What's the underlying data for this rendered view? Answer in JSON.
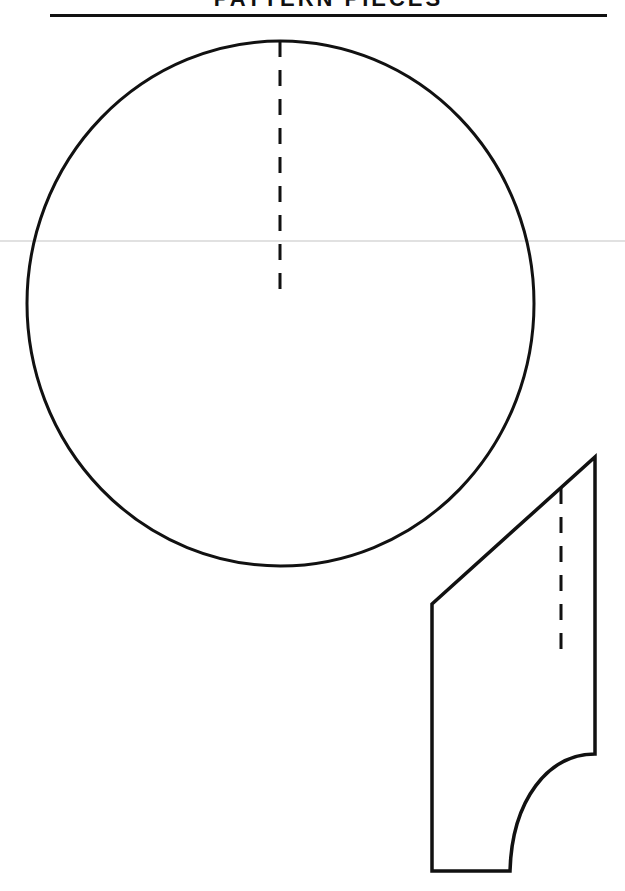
{
  "document": {
    "header_title_clipped": "PATTERN PIECES",
    "colors": {
      "ink": "#111111",
      "paper": "#ffffff",
      "scan_line": "#d9d9d9"
    }
  },
  "pattern_pieces": [
    {
      "name": "circle-piece",
      "shape": "ellipse",
      "center": [
        280.5,
        303.5
      ],
      "radius_x": 253.5,
      "radius_y": 262.5,
      "guide_line": {
        "style": "dashed",
        "x": 280,
        "y_start": 41,
        "y_end": 292
      }
    },
    {
      "name": "angled-piece",
      "shape": "polygon-with-curve",
      "outline_points": [
        [
          432,
          604
        ],
        [
          595,
          457
        ],
        [
          595,
          754
        ],
        [
          510,
          871
        ],
        [
          432,
          871
        ]
      ],
      "curve": {
        "from": [
          595,
          754
        ],
        "to": [
          510,
          871
        ],
        "type": "concave-arc"
      },
      "guide_line": {
        "style": "dashed",
        "x": 561,
        "y_start": 488,
        "y_end": 650
      }
    }
  ]
}
